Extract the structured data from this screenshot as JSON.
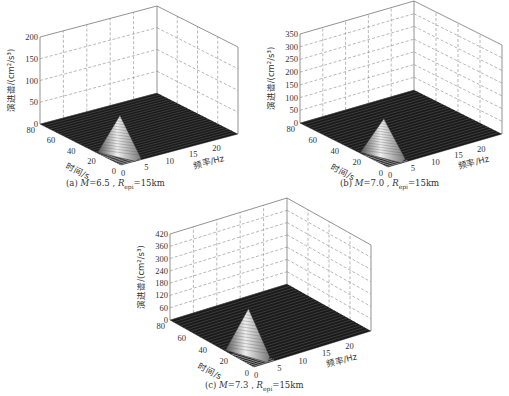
{
  "chart_data": [
    {
      "id": "a",
      "type": "surface3d",
      "caption": {
        "prefix": "(a) ",
        "M": "M",
        "mag": "=6.5",
        "R": "R",
        "sub": "epi",
        "dist": "=15km"
      },
      "xlabel": "频率/Hz",
      "ylabel": "时间/s",
      "zlabel": "演进谱/(cm²/s³)",
      "x_ticks": [
        0,
        5,
        10,
        15,
        20
      ],
      "y_ticks": [
        0,
        20,
        40,
        60,
        80
      ],
      "z_ticks": [
        0,
        50,
        100,
        150,
        200
      ],
      "xlim": [
        0,
        25
      ],
      "ylim": [
        0,
        80
      ],
      "zlim": [
        0,
        200
      ],
      "peak": {
        "frequency_hz": 1.5,
        "time_s": 8,
        "value": 100
      },
      "grid": true
    },
    {
      "id": "b",
      "type": "surface3d",
      "caption": {
        "prefix": "(b) ",
        "M": "M",
        "mag": "=7.0",
        "R": "R",
        "sub": "epi",
        "dist": "=15km"
      },
      "xlabel": "频率/Hz",
      "ylabel": "时间/s",
      "zlabel": "演进谱/(cm²/s³)",
      "x_ticks": [
        0,
        5,
        10,
        15,
        20
      ],
      "y_ticks": [
        0,
        20,
        40,
        60,
        80
      ],
      "z_ticks": [
        0,
        50,
        100,
        150,
        200,
        250,
        300,
        350
      ],
      "xlim": [
        0,
        25
      ],
      "ylim": [
        0,
        80
      ],
      "zlim": [
        0,
        350
      ],
      "peak": {
        "frequency_hz": 1.5,
        "time_s": 10,
        "value": 160
      },
      "grid": true
    },
    {
      "id": "c",
      "type": "surface3d",
      "caption": {
        "prefix": "(c) ",
        "M": "M",
        "mag": "=7.3",
        "R": "R",
        "sub": "epi",
        "dist": "=15km"
      },
      "xlabel": "频率/Hz",
      "ylabel": "时间/s",
      "zlabel": "演进谱/(cm²/s³)",
      "x_ticks": [
        0,
        5,
        10,
        15,
        20
      ],
      "y_ticks": [
        0,
        20,
        40,
        60,
        80
      ],
      "z_ticks": [
        0,
        60,
        120,
        180,
        240,
        300,
        360,
        420
      ],
      "xlim": [
        0,
        25
      ],
      "ylim": [
        0,
        80
      ],
      "zlim": [
        0,
        420
      ],
      "peak": {
        "frequency_hz": 1.5,
        "time_s": 12,
        "value": 240
      },
      "grid": true
    }
  ],
  "layout": {
    "panels": [
      {
        "id": "a",
        "left": 40,
        "front": [
          121,
          165
        ],
        "right": 238,
        "back_x": 152,
        "floor_left_y": 124,
        "floor_right_y": 134,
        "height": 87,
        "cap_x": 66,
        "cap_y": 178
      },
      {
        "id": "b",
        "left": 300,
        "front": [
          388,
          167
        ],
        "right": 502,
        "back_x": 416,
        "floor_left_y": 123,
        "floor_right_y": 134,
        "height": 89,
        "cap_x": 340,
        "cap_y": 178
      },
      {
        "id": "c",
        "left": 170,
        "front": [
          254,
          367
        ],
        "right": 371,
        "back_x": 284,
        "floor_left_y": 320,
        "floor_right_y": 331,
        "height": 86,
        "cap_x": 205,
        "cap_y": 380
      }
    ]
  }
}
